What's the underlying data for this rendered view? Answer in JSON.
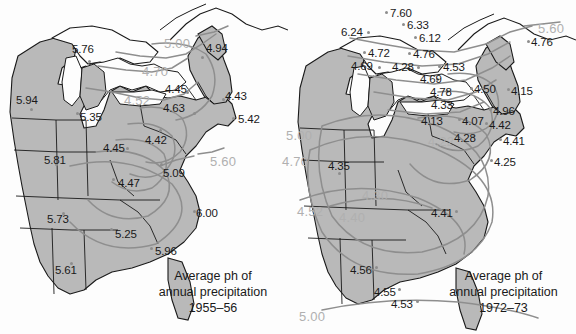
{
  "figure": {
    "colors": {
      "land_fill": "#b9b9b9",
      "water_fill": "#fdfdfd",
      "border_stroke": "#1a1a1a",
      "contour_stroke": "#8e8e8e",
      "contour_label": "#b0b0b0",
      "point_label": "#1a1a1a",
      "point_dot": "#8d8d8d"
    }
  },
  "maps": [
    {
      "id": "map-left",
      "caption_lines": [
        "Average ph of",
        "annual precipitation",
        "1955–56"
      ],
      "period": "1955–56",
      "station_values": [
        {
          "value": "5.76",
          "x": 72,
          "y": 44,
          "dot_x": 88,
          "dot_y": 60
        },
        {
          "value": "4.94",
          "x": 206,
          "y": 43,
          "dot_x": 201,
          "dot_y": 56
        },
        {
          "value": "5.94",
          "x": 16,
          "y": 95,
          "dot_x": 30,
          "dot_y": 108
        },
        {
          "value": "5.35",
          "x": 80,
          "y": 112,
          "dot_x": 76,
          "dot_y": 112
        },
        {
          "value": "4.45",
          "x": 165,
          "y": 84,
          "dot_x": 186,
          "dot_y": 91
        },
        {
          "value": "4.63",
          "x": 163,
          "y": 103,
          "dot_x": 193,
          "dot_y": 112
        },
        {
          "value": "4.43",
          "x": 225,
          "y": 91,
          "dot_x": 222,
          "dot_y": 98
        },
        {
          "value": "5.42",
          "x": 238,
          "y": 114,
          "dot_x": 232,
          "dot_y": 117
        },
        {
          "value": "4.42",
          "x": 145,
          "y": 135,
          "dot_x": 159,
          "dot_y": 129
        },
        {
          "value": "4.45",
          "x": 103,
          "y": 143,
          "dot_x": 126,
          "dot_y": 147
        },
        {
          "value": "5.81",
          "x": 44,
          "y": 155,
          "dot_x": 55,
          "dot_y": 163
        },
        {
          "value": "5.09",
          "x": 163,
          "y": 168,
          "dot_x": 160,
          "dot_y": 163
        },
        {
          "value": "4.47",
          "x": 118,
          "y": 178,
          "dot_x": 112,
          "dot_y": 178
        },
        {
          "value": "6.00",
          "x": 196,
          "y": 208,
          "dot_x": 193,
          "dot_y": 210
        },
        {
          "value": "5.73",
          "x": 47,
          "y": 214,
          "dot_x": 62,
          "dot_y": 212
        },
        {
          "value": "5.25",
          "x": 115,
          "y": 229,
          "dot_x": 110,
          "dot_y": 228
        },
        {
          "value": "5.96",
          "x": 155,
          "y": 246,
          "dot_x": 150,
          "dot_y": 247
        },
        {
          "value": "5.61",
          "x": 55,
          "y": 265,
          "dot_x": 70,
          "dot_y": 262
        }
      ],
      "contour_labels": [
        {
          "value": "5.00",
          "x": 164,
          "y": 37
        },
        {
          "value": "4.70",
          "x": 142,
          "y": 65
        },
        {
          "value": "4.52",
          "x": 124,
          "y": 94
        },
        {
          "value": "5.60",
          "x": 210,
          "y": 155
        }
      ]
    },
    {
      "id": "map-right",
      "caption_lines": [
        "Average ph of",
        "annual precipitation",
        "1972–73"
      ],
      "period": "1972–73",
      "station_values": [
        {
          "value": "7.60",
          "x": 102,
          "y": 8,
          "dot_x": 97,
          "dot_y": 11
        },
        {
          "value": "6.33",
          "x": 119,
          "y": 20,
          "dot_x": 114,
          "dot_y": 23
        },
        {
          "value": "6.24",
          "x": 53,
          "y": 27,
          "dot_x": 79,
          "dot_y": 31
        },
        {
          "value": "6.12",
          "x": 131,
          "y": 33,
          "dot_x": 126,
          "dot_y": 36
        },
        {
          "value": "4.72",
          "x": 80,
          "y": 48,
          "dot_x": 75,
          "dot_y": 51
        },
        {
          "value": "4.76",
          "x": 125,
          "y": 49,
          "dot_x": 120,
          "dot_y": 52
        },
        {
          "value": "4.69",
          "x": 63,
          "y": 61,
          "dot_x": 90,
          "dot_y": 66
        },
        {
          "value": "4.28",
          "x": 104,
          "y": 62,
          "dot_x": 129,
          "dot_y": 66
        },
        {
          "value": "4.53",
          "x": 155,
          "y": 62,
          "dot_x": 150,
          "dot_y": 65
        },
        {
          "value": "4.76",
          "x": 243,
          "y": 37,
          "dot_x": 239,
          "dot_y": 40
        },
        {
          "value": "4.69",
          "x": 132,
          "y": 74,
          "dot_x": 148,
          "dot_y": 78
        },
        {
          "value": "4.78",
          "x": 142,
          "y": 87,
          "dot_x": 158,
          "dot_y": 90
        },
        {
          "value": "4.50",
          "x": 186,
          "y": 84,
          "dot_x": 182,
          "dot_y": 87
        },
        {
          "value": "4.15",
          "x": 223,
          "y": 86,
          "dot_x": 219,
          "dot_y": 88
        },
        {
          "value": "4.33",
          "x": 143,
          "y": 100,
          "dot_x": 160,
          "dot_y": 103
        },
        {
          "value": "4.96",
          "x": 205,
          "y": 106,
          "dot_x": 201,
          "dot_y": 108
        },
        {
          "value": "4.13",
          "x": 133,
          "y": 116,
          "dot_x": 148,
          "dot_y": 117
        },
        {
          "value": "4.07",
          "x": 174,
          "y": 116,
          "dot_x": 170,
          "dot_y": 118
        },
        {
          "value": "4.42",
          "x": 201,
          "y": 120,
          "dot_x": 197,
          "dot_y": 122
        },
        {
          "value": "4.28",
          "x": 166,
          "y": 133,
          "dot_x": 184,
          "dot_y": 135
        },
        {
          "value": "4.41",
          "x": 215,
          "y": 136,
          "dot_x": 211,
          "dot_y": 138
        },
        {
          "value": "4.25",
          "x": 206,
          "y": 157,
          "dot_x": 202,
          "dot_y": 159
        },
        {
          "value": "4.35",
          "x": 40,
          "y": 161,
          "dot_x": 50,
          "dot_y": 172
        },
        {
          "value": "4.41",
          "x": 143,
          "y": 208,
          "dot_x": 167,
          "dot_y": 210
        },
        {
          "value": "4.56",
          "x": 62,
          "y": 265,
          "dot_x": 87,
          "dot_y": 266
        },
        {
          "value": "4.55",
          "x": 86,
          "y": 287,
          "dot_x": 110,
          "dot_y": 288
        },
        {
          "value": "4.53",
          "x": 103,
          "y": 299,
          "dot_x": 128,
          "dot_y": 300
        }
      ],
      "contour_labels": [
        {
          "value": "5.60",
          "x": 250,
          "y": 22
        },
        {
          "value": "5.00",
          "x": -2,
          "y": 129
        },
        {
          "value": "4.70",
          "x": -6,
          "y": 155
        },
        {
          "value": "4.22",
          "x": 140,
          "y": 135
        },
        {
          "value": "4.30",
          "x": 74,
          "y": 189
        },
        {
          "value": "4.52",
          "x": 9,
          "y": 205
        },
        {
          "value": "4.40",
          "x": 51,
          "y": 211
        },
        {
          "value": "5.00",
          "x": 11,
          "y": 310
        }
      ]
    }
  ]
}
